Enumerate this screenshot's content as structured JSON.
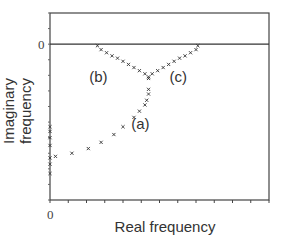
{
  "chart_data": {
    "type": "scatter",
    "title": "",
    "xlabel": "Real frequency",
    "ylabel": "Imaginary frequency",
    "x_tick_labels": [
      "0"
    ],
    "y_tick_labels": [
      "0"
    ],
    "xlim": [
      0,
      12
    ],
    "ylim": [
      -10,
      2
    ],
    "grid": false,
    "legend": null,
    "reference_line": {
      "y": 0,
      "label": "0"
    },
    "marker": "x",
    "annotations": [
      {
        "text": "(a)",
        "x": 5.0,
        "y": -5.1
      },
      {
        "text": "(b)",
        "x": 2.7,
        "y": -2.1
      },
      {
        "text": "(c)",
        "x": 7.1,
        "y": -2.1
      }
    ],
    "series": [
      {
        "name": "(a)",
        "points": [
          [
            0.0,
            -5.3
          ],
          [
            0.0,
            -5.6
          ],
          [
            0.0,
            -6.0
          ],
          [
            0.0,
            -6.5
          ],
          [
            0.0,
            -7.3
          ],
          [
            0.0,
            -7.7
          ],
          [
            0.0,
            -8.3
          ],
          [
            0.3,
            -7.2
          ],
          [
            1.2,
            -7.0
          ],
          [
            2.1,
            -6.7
          ],
          [
            2.8,
            -6.3
          ],
          [
            3.5,
            -5.8
          ],
          [
            4.0,
            -5.3
          ],
          [
            4.6,
            -4.7
          ],
          [
            4.9,
            -4.3
          ],
          [
            5.2,
            -3.9
          ],
          [
            5.3,
            -3.6
          ],
          [
            5.4,
            -3.2
          ],
          [
            5.4,
            -2.9
          ],
          [
            5.4,
            -2.2
          ]
        ]
      },
      {
        "name": "(b)",
        "points": [
          [
            2.6,
            -0.1
          ],
          [
            2.8,
            -0.35
          ],
          [
            3.1,
            -0.55
          ],
          [
            3.4,
            -0.75
          ],
          [
            3.7,
            -0.9
          ],
          [
            4.0,
            -1.1
          ],
          [
            4.3,
            -1.3
          ],
          [
            4.6,
            -1.5
          ],
          [
            4.9,
            -1.7
          ],
          [
            5.2,
            -1.9
          ],
          [
            5.4,
            -2.1
          ]
        ]
      },
      {
        "name": "(c)",
        "points": [
          [
            5.6,
            -1.9
          ],
          [
            5.9,
            -1.7
          ],
          [
            6.2,
            -1.5
          ],
          [
            6.5,
            -1.3
          ],
          [
            6.8,
            -1.1
          ],
          [
            7.1,
            -0.9
          ],
          [
            7.4,
            -0.75
          ],
          [
            7.7,
            -0.55
          ],
          [
            8.0,
            -0.35
          ],
          [
            8.1,
            -0.1
          ]
        ]
      }
    ]
  }
}
